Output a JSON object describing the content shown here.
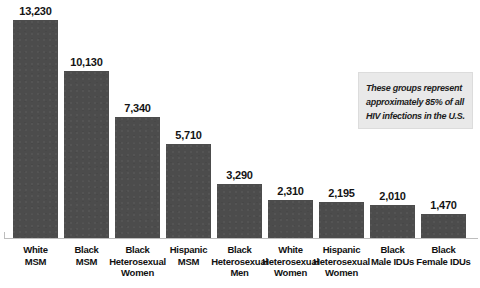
{
  "chart_data": {
    "type": "bar",
    "title": "",
    "subtitle": "",
    "xlabel": "",
    "ylabel": "",
    "ylim": [
      0,
      13230
    ],
    "grid": false,
    "legend": "none",
    "categories": [
      "White MSM",
      "Black MSM",
      "Black Heterosexual Women",
      "Hispanic MSM",
      "Black Heterosexual Men",
      "White Heterosexual Women",
      "Hispanic Heterosexual Women",
      "Black Male IDUs",
      "Black Female IDUs"
    ],
    "values": [
      13230,
      10130,
      7340,
      5710,
      3290,
      2310,
      2195,
      2010,
      1470
    ],
    "value_labels": [
      "13,230",
      "10,130",
      "7,340",
      "5,710",
      "3,290",
      "2,310",
      "2,195",
      "2,010",
      "1,470"
    ],
    "bars": [
      {
        "category_lines": [
          "White",
          "MSM"
        ],
        "category": "White MSM",
        "value": 13230,
        "value_label": "13,230"
      },
      {
        "category_lines": [
          "Black",
          "MSM"
        ],
        "category": "Black MSM",
        "value": 10130,
        "value_label": "10,130"
      },
      {
        "category_lines": [
          "Black",
          "Heterosexual",
          "Women"
        ],
        "category": "Black Heterosexual Women",
        "value": 7340,
        "value_label": "7,340"
      },
      {
        "category_lines": [
          "Hispanic",
          "MSM"
        ],
        "category": "Hispanic MSM",
        "value": 5710,
        "value_label": "5,710"
      },
      {
        "category_lines": [
          "Black",
          "Heterosexual",
          "Men"
        ],
        "category": "Black Heterosexual Men",
        "value": 3290,
        "value_label": "3,290"
      },
      {
        "category_lines": [
          "White",
          "Heterosexual",
          "Women"
        ],
        "category": "White Heterosexual Women",
        "value": 2310,
        "value_label": "2,310"
      },
      {
        "category_lines": [
          "Hispanic",
          "Heterosexual",
          "Women"
        ],
        "category": "Hispanic Heterosexual Women",
        "value": 2195,
        "value_label": "2,195"
      },
      {
        "category_lines": [
          "Black",
          "Male IDUs"
        ],
        "category": "Black Male IDUs",
        "value": 2010,
        "value_label": "2,010"
      },
      {
        "category_lines": [
          "Black",
          "Female IDUs"
        ],
        "category": "Black Female IDUs",
        "value": 1470,
        "value_label": "1,470"
      }
    ],
    "annotations": [
      {
        "id": "callout",
        "text": "These groups represent approximately 85% of all HIV infections in the U.S."
      }
    ],
    "colors": {
      "bar_fill": "#4c4c4c",
      "value_label": "#141414",
      "category_label": "#111111",
      "axis_line": "#bdbdbd",
      "callout_background": "#e9e9e9",
      "callout_text": "#1d1d1d",
      "page_background": "#ffffff"
    }
  },
  "callout": {
    "text": "These groups represent approximately 85% of all HIV infections in the U.S."
  }
}
